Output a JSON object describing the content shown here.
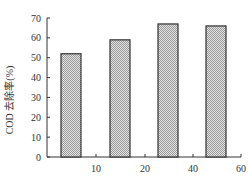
{
  "chart_data": {
    "type": "bar",
    "title": "",
    "xlabel": "",
    "ylabel": "COD 去除率(%)",
    "categories": [
      "5",
      "15",
      "35",
      "55"
    ],
    "values": [
      52,
      59,
      67,
      66
    ],
    "ylim": [
      0,
      70
    ],
    "yticks": [
      0,
      10,
      20,
      30,
      40,
      50,
      60,
      70
    ],
    "xticks": [
      "10",
      "20",
      "40",
      "60"
    ],
    "grid": false,
    "legend": null,
    "bar_fill": "#c8c8c8",
    "bar_edge": "#333333"
  }
}
